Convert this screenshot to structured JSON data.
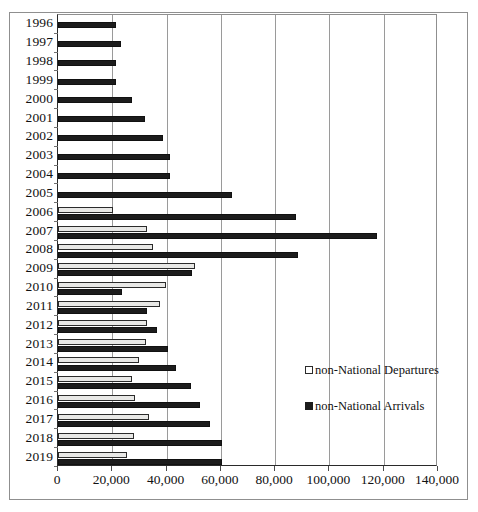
{
  "chart_data": {
    "type": "bar",
    "orientation": "horizontal",
    "title": "",
    "xlabel": "",
    "ylabel": "",
    "xlim": [
      0,
      140000
    ],
    "xticks": [
      0,
      20000,
      40000,
      60000,
      80000,
      100000,
      120000,
      140000
    ],
    "xtick_labels": [
      "0",
      "20,000",
      "40,000",
      "60,000",
      "80,000",
      "100,000",
      "120,000",
      "140,000"
    ],
    "grid": "vertical",
    "legend_position": "inside-right",
    "categories": [
      "1996",
      "1997",
      "1998",
      "1999",
      "2000",
      "2001",
      "2002",
      "2003",
      "2004",
      "2005",
      "2006",
      "2007",
      "2008",
      "2009",
      "2010",
      "2011",
      "2012",
      "2013",
      "2014",
      "2015",
      "2016",
      "2017",
      "2018",
      "2019"
    ],
    "series": [
      {
        "name": "non-National Departures",
        "color": "#e8e8e6",
        "edge_color": "#2b2b2b",
        "values": [
          null,
          null,
          null,
          null,
          null,
          null,
          null,
          null,
          null,
          null,
          20200,
          32700,
          35100,
          50600,
          39900,
          37700,
          32700,
          32600,
          29800,
          27100,
          28300,
          33700,
          27900,
          25400
        ]
      },
      {
        "name": "non-National Arrivals",
        "color": "#1c1c1c",
        "edge_color": "#111111",
        "values": [
          21500,
          23300,
          21500,
          21500,
          27300,
          32200,
          38600,
          41100,
          41100,
          64000,
          87700,
          117400,
          88500,
          49500,
          23700,
          32700,
          36300,
          40600,
          43500,
          49000,
          52400,
          56000,
          60600,
          60600
        ]
      }
    ]
  },
  "legend": {
    "items": [
      {
        "label": "non-National Departures",
        "marker": "open-square-marker"
      },
      {
        "label": "non-National Arrivals",
        "marker": "filled-square-marker"
      }
    ]
  }
}
